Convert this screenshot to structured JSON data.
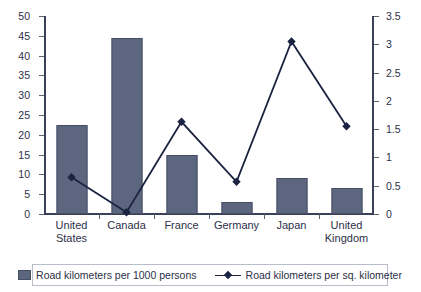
{
  "chart_data": {
    "type": "bar",
    "title": "",
    "xlabel": "",
    "categories": [
      "United States",
      "Canada",
      "France",
      "Germany",
      "Japan",
      "United Kingdom"
    ],
    "categories_wrapped": [
      [
        "United",
        "States"
      ],
      [
        "Canada"
      ],
      [
        "France"
      ],
      [
        "Germany"
      ],
      [
        "Japan"
      ],
      [
        "United",
        "Kingdom"
      ]
    ],
    "series": [
      {
        "name": "Road kilometers per 1000 persons",
        "type": "bar",
        "axis": "left",
        "color": "#5c677f",
        "values": [
          22.5,
          44.5,
          15,
          3,
          9,
          6.5
        ]
      },
      {
        "name": "Road kilometers per sq. kilometer",
        "type": "line",
        "axis": "right",
        "color": "#1b2340",
        "values": [
          0.65,
          0.03,
          1.63,
          0.57,
          3.05,
          1.55
        ]
      }
    ],
    "left_axis": {
      "label": "",
      "ylim": [
        0,
        50
      ],
      "tick_step": 5,
      "ticks": [
        "0",
        "5",
        "10",
        "15",
        "20",
        "25",
        "30",
        "35",
        "40",
        "45",
        "50"
      ]
    },
    "right_axis": {
      "label": "",
      "ylim": [
        0,
        3.5
      ],
      "tick_step": 0.5,
      "ticks": [
        "0",
        "0.5",
        "1",
        "1.5",
        "2",
        "2.5",
        "3",
        "3.5"
      ]
    },
    "grid": false,
    "legend_position": "bottom"
  },
  "legend": {
    "items": [
      {
        "label": "Road kilometers per 1000 persons",
        "marker": "square-swatch"
      },
      {
        "label": "Road kilometers per sq. kilometer",
        "marker": "line-with-diamond"
      }
    ]
  },
  "colors": {
    "bar": "#5c677f",
    "bar_border": "#474f66",
    "line": "#1b2340",
    "axis": "#3a4057",
    "text": "#2b3048",
    "legend_border": "#b9bdc9",
    "background": "#ffffff"
  }
}
